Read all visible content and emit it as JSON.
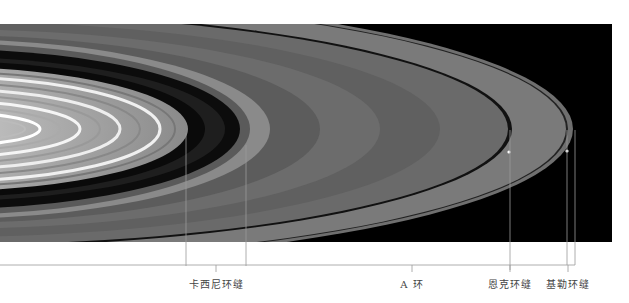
{
  "figure": {
    "labels": [
      {
        "id": "cassini",
        "text": "卡西尼环缝"
      },
      {
        "id": "a-ring",
        "text": "A 环"
      },
      {
        "id": "encke",
        "text": "恩克环缝"
      },
      {
        "id": "keeler",
        "text": "基勒环缝"
      }
    ]
  }
}
